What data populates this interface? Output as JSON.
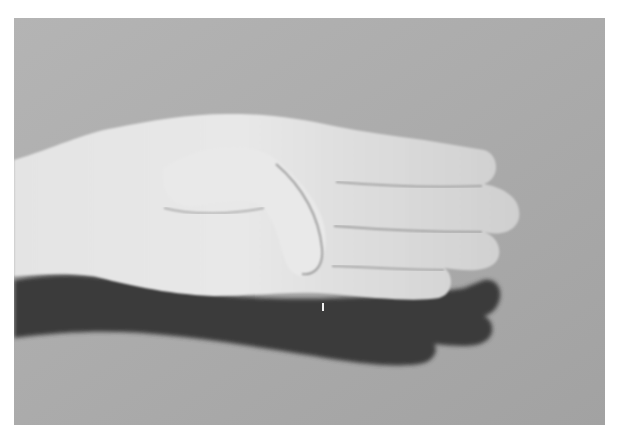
{
  "image": {
    "description": "Grayscale photograph of a hand viewed from the side with four fingers extended and the thumb tucked across the palm, casting a dark shadow below",
    "frame": {
      "x": 14,
      "y": 18,
      "width": 591,
      "height": 407
    },
    "colors": {
      "page_background": "#ffffff",
      "backdrop": "#a8a8a8",
      "backdrop_light": "#b8b8b8",
      "skin_highlight": "#ececec",
      "skin": "#d6d6d6",
      "skin_shade": "#bdbdbd",
      "crease": "#9a9a9a",
      "shadow": "#3a3a3a"
    },
    "subjects": [
      "hand",
      "thumb",
      "index-finger",
      "middle-finger",
      "ring-finger",
      "little-finger",
      "shadow"
    ]
  }
}
